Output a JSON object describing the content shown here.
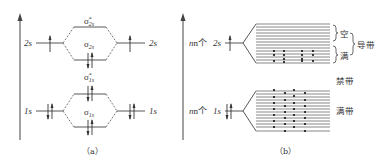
{
  "panel_a": {
    "caption": "（a）",
    "left_labels": {
      "upper": "2s",
      "lower": "1s"
    },
    "right_labels": {
      "upper": "2s",
      "lower": "1s"
    },
    "orbitals": {
      "sigma_2s_star": {
        "symbol": "σ",
        "sub": "2s",
        "sup": "*"
      },
      "sigma_2s": {
        "symbol": "σ",
        "sub": "2s"
      },
      "sigma_1s_star": {
        "symbol": "σ",
        "sub": "1s",
        "sup": "*"
      },
      "sigma_1s": {
        "symbol": "σ",
        "sub": "1s"
      }
    }
  },
  "panel_b": {
    "caption": "（b）",
    "left_labels": {
      "upper_prefix": "n个",
      "upper": "2s",
      "lower_prefix": "n个",
      "lower": "1s"
    },
    "band_labels": {
      "empty": "空",
      "full": "满",
      "conduction_band": "导带",
      "forbidden_band": "禁带",
      "valence_band": "满带"
    }
  },
  "colors": {
    "line": "#444444",
    "dash": "#555555",
    "text": "#333333",
    "dot": "#111111"
  }
}
